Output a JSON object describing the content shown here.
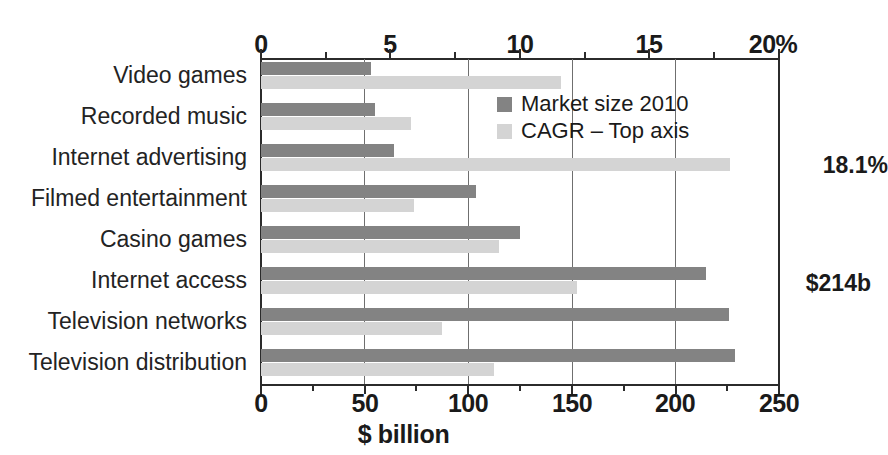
{
  "chart_data": {
    "type": "bar",
    "orientation": "horizontal",
    "title": "",
    "xlabel": "$ billion",
    "ylabel": "",
    "categories": [
      "Video games",
      "Recorded music",
      "Internet advertising",
      "Filmed entertainment",
      "Casino games",
      "Internet access",
      "Television networks",
      "Television distribution"
    ],
    "series": [
      {
        "name": "Market size 2010",
        "axis": "bottom",
        "unit": "$ billion",
        "color": "#838383",
        "values": [
          53,
          55,
          64,
          104,
          125,
          215,
          226,
          229
        ]
      },
      {
        "name": "CAGR – Top axis",
        "axis": "top",
        "unit": "%",
        "color": "#d4d4d4",
        "values": [
          11.6,
          5.8,
          18.1,
          5.9,
          9.2,
          12.2,
          7.0,
          9.0
        ]
      }
    ],
    "bottom_axis": {
      "label": "$ billion",
      "min": 0,
      "max": 250,
      "ticks": [
        0,
        50,
        100,
        150,
        200,
        250
      ],
      "tick_labels": [
        "0",
        "50",
        "100",
        "150",
        "200",
        "250"
      ],
      "minor_ticks": [
        25,
        75,
        125,
        175,
        225
      ]
    },
    "top_axis": {
      "label": "%",
      "min": 0,
      "max": 20,
      "ticks": [
        0,
        5,
        10,
        15,
        20
      ],
      "tick_labels": [
        "0",
        "5",
        "10",
        "15",
        "20%"
      ],
      "minor_ticks": [
        2.5,
        7.5,
        12.5,
        17.5
      ]
    },
    "annotations": [
      {
        "category": "Internet advertising",
        "series": "CAGR – Top axis",
        "text": "18.1%"
      },
      {
        "category": "Internet access",
        "series": "Market size 2010",
        "text": "$214b"
      }
    ],
    "legend": {
      "position": "inside-top-right",
      "entries": [
        {
          "label": "Market size 2010",
          "color": "#838383"
        },
        {
          "label": "CAGR – Top axis",
          "color": "#d4d4d4"
        }
      ]
    },
    "grid": {
      "vertical": true,
      "horizontal": false
    }
  }
}
